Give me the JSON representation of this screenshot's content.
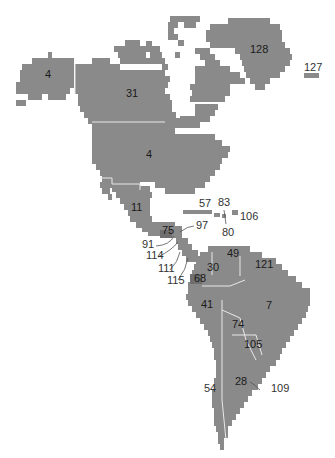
{
  "map": {
    "title": "Americas region map",
    "colors": {
      "land": "#8a8a8a",
      "highlight": "#6f6f6f",
      "border": "#e8e8e8",
      "background": "#ffffff"
    },
    "regions": [
      {
        "id": "alaska",
        "label": "4"
      },
      {
        "id": "canada",
        "label": "31"
      },
      {
        "id": "greenland",
        "label": "128"
      },
      {
        "id": "iceland",
        "label": "127"
      },
      {
        "id": "usa",
        "label": "4"
      },
      {
        "id": "mexico",
        "label": "11"
      },
      {
        "id": "cuba",
        "label": "57"
      },
      {
        "id": "haiti",
        "label": "83"
      },
      {
        "id": "dominican-republic",
        "label": "80"
      },
      {
        "id": "puerto-rico",
        "label": "106"
      },
      {
        "id": "guatemala",
        "label": "75"
      },
      {
        "id": "belize",
        "label": "97"
      },
      {
        "id": "el-salvador",
        "label": "91"
      },
      {
        "id": "honduras",
        "label": "114"
      },
      {
        "id": "nicaragua",
        "label": "111"
      },
      {
        "id": "costa-rica-panama",
        "label": "115"
      },
      {
        "id": "venezuela",
        "label": "49"
      },
      {
        "id": "colombia",
        "label": "30"
      },
      {
        "id": "guyana-region",
        "label": "121"
      },
      {
        "id": "ecuador",
        "label": "68"
      },
      {
        "id": "peru",
        "label": "41"
      },
      {
        "id": "brazil",
        "label": "7"
      },
      {
        "id": "bolivia",
        "label": "74"
      },
      {
        "id": "paraguay",
        "label": "105"
      },
      {
        "id": "argentina",
        "label": "28"
      },
      {
        "id": "chile",
        "label": "54"
      },
      {
        "id": "uruguay",
        "label": "109"
      }
    ]
  }
}
